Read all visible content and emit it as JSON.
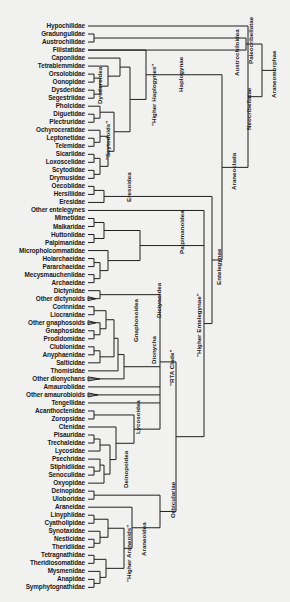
{
  "figure": {
    "type": "phylogenetic-tree",
    "background": "#f1f1ef",
    "line_color": "#1f1f1f"
  },
  "taxa": [
    "Hypochilidae",
    "Gradungulidae",
    "Austrochilidae",
    "Filistatidae",
    "Caponiidae",
    "Tetrablemmidae",
    "Orsolobidae",
    "Oonopidae",
    "Dysderidae",
    "Segestriidae",
    "Pholcidae",
    "Diguetidae",
    "Plectruridae",
    "Ochyroceratidae",
    "Leptonetidae",
    "Telemidae",
    "Sicariidae",
    "Loxoscelidae",
    "Scytodidae",
    "Drymusidae",
    "Oecobiidae",
    "Hersiliidae",
    "Eresidae",
    "Other entelegynes",
    "Mimetidae",
    "Malkaridae",
    "Huttoniidae",
    "Palpimanidae",
    "Micropholcommatidae",
    "Holarchaeidae",
    "Pararchaeidae",
    "Mecysmaucheniidae",
    "Archaeidae",
    "Dictynidae",
    "Other dictynoids",
    "Corinnidae",
    "Liocranidae",
    "Other gnaphosoids",
    "Gnaphosidae",
    "Prodidomidae",
    "Clubionidae",
    "Anyphaenidae",
    "Salticidae",
    "Thomisidae",
    "Other dionychans",
    "Amaurobiidae",
    "Other amaurobioids",
    "Tengellidae",
    "Acanthoctenidae",
    "Zoropsidae",
    "Ctenidae",
    "Pisauridae",
    "Trechaleidae",
    "Lycosidae",
    "Psechridae",
    "Stiphidiidae",
    "Senoculidae",
    "Oxyopidae",
    "Deinopidae",
    "Uloboridae",
    "Araneidae",
    "Linyphiidae",
    "Cyatholipidae",
    "Synotaxidae",
    "Nesticidae",
    "Theridiidae",
    "Tetragnathidae",
    "Theridiosomatidae",
    "Mysmenidae",
    "Anapidae",
    "Symphytognathidae"
  ],
  "clades": {
    "dysderoidea": "Dysderoidea",
    "scytodoids": "\"Scytodoids\"",
    "higher_haplogynes": "\"Higher Haplogynes\"",
    "haplogynae": "Haplogynae",
    "eresoidea": "Eresoidea",
    "palpimanoidea": "Palpimanoidea",
    "dictynoidea": "Dictynoidea",
    "gnaphosoidea": "Gnaphosoidea",
    "dionycha": "Dionycha",
    "rta_clade": "\"RTA Clade\"",
    "lycosoidea": "Lycosoidea",
    "deinopoidea": "Deinopoidea",
    "higher_araneoids": "\"Higher Araneoids\"",
    "araneoidea": "Araneoidea",
    "orbiculariae": "Orbiculariae",
    "higher_entelegynae": "\"Higher Entelegynae\"",
    "entelegynae": "Entelegynae",
    "araneoclada": "Araneoclada",
    "austrochiloidea": "Austrochiloidea",
    "neocribellatae": "Neocribellatae",
    "paleocribellatae": "Paleocribellatae",
    "araneomorphae": "Araneomorphae"
  }
}
